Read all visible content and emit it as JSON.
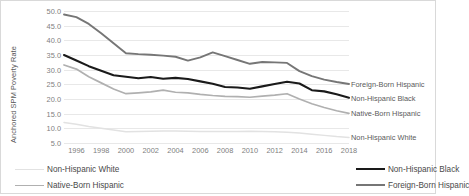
{
  "chart_data": {
    "type": "line",
    "title": "",
    "xlabel": "",
    "ylabel": "Anchored SPM Poverty Rate",
    "xlim": [
      1995,
      2018
    ],
    "ylim": [
      5.0,
      50.0
    ],
    "ytick_step": 5.0,
    "grid": true,
    "legend_position": "bottom",
    "x": [
      1995,
      1996,
      1997,
      1998,
      1999,
      2000,
      2001,
      2002,
      2003,
      2004,
      2005,
      2006,
      2007,
      2008,
      2009,
      2010,
      2011,
      2012,
      2013,
      2014,
      2015,
      2016,
      2017,
      2018
    ],
    "ytick_labels": [
      "50.0",
      "45.0",
      "40.0",
      "35.0",
      "30.0",
      "25.0",
      "20.0",
      "15.0",
      "10.0",
      "5.0"
    ],
    "ytick_values": [
      50.0,
      45.0,
      40.0,
      35.0,
      30.0,
      25.0,
      20.0,
      15.0,
      10.0,
      5.0
    ],
    "xtick_labels": [
      "1996",
      "1998",
      "2000",
      "2002",
      "2004",
      "2006",
      "2008",
      "2010",
      "2012",
      "2014",
      "2016",
      "2018"
    ],
    "xtick_values": [
      1996,
      1998,
      2000,
      2002,
      2004,
      2006,
      2008,
      2010,
      2012,
      2014,
      2016,
      2018
    ],
    "series": [
      {
        "name": "Foreign-Born Hispanic",
        "color": "#767676",
        "width": 1.9,
        "values": [
          48.8,
          47.9,
          45.6,
          42.4,
          39.0,
          35.6,
          35.3,
          35.1,
          34.8,
          34.4,
          33.1,
          34.2,
          35.9,
          34.6,
          33.3,
          32.0,
          32.6,
          32.5,
          32.3,
          29.5,
          27.8,
          26.6,
          25.8,
          25.1
        ]
      },
      {
        "name": "Non-Hispanic Black",
        "color": "#1a1a1a",
        "width": 2.1,
        "values": [
          35.0,
          33.1,
          31.2,
          29.6,
          28.1,
          27.6,
          27.1,
          27.5,
          26.9,
          27.2,
          26.8,
          26.0,
          25.2,
          24.1,
          23.9,
          23.5,
          24.3,
          25.1,
          25.9,
          25.3,
          23.0,
          22.6,
          21.6,
          20.4
        ]
      },
      {
        "name": "Native-Born Hispanic",
        "color": "#b0b0b0",
        "width": 1.7,
        "values": [
          31.6,
          30.2,
          27.6,
          25.5,
          23.4,
          21.8,
          22.1,
          22.4,
          23.0,
          22.3,
          22.1,
          21.6,
          21.2,
          20.9,
          20.8,
          20.6,
          21.0,
          21.3,
          21.8,
          20.0,
          18.4,
          17.1,
          16.0,
          15.1
        ]
      },
      {
        "name": "Non-Hispanic White",
        "color": "#e2e2e2",
        "width": 1.5,
        "values": [
          12.0,
          11.4,
          10.6,
          10.0,
          9.4,
          8.8,
          8.9,
          9.0,
          9.1,
          9.1,
          9.0,
          8.9,
          8.9,
          8.9,
          8.9,
          9.0,
          8.9,
          8.8,
          8.7,
          8.4,
          8.0,
          7.6,
          7.2,
          6.9
        ]
      }
    ],
    "series_annotations": [
      {
        "label": "Foreign-Born Hispanic",
        "value": 25.1
      },
      {
        "label": "Non-Hispanic Black",
        "value": 20.4
      },
      {
        "label": "Native-Born Hispanic",
        "value": 15.1
      },
      {
        "label": "Non-Hispanic White",
        "value": 6.9
      }
    ],
    "legend": [
      {
        "label": "Non-Hispanic White",
        "color": "#e2e2e2",
        "width": 1.5
      },
      {
        "label": "Non-Hispanic Black",
        "color": "#1a1a1a",
        "width": 2.4
      },
      {
        "label": "Native-Born Hispanic",
        "color": "#b0b0b0",
        "width": 1.7
      },
      {
        "label": "Foreign-Born Hispanic",
        "color": "#767676",
        "width": 2.1
      }
    ]
  }
}
